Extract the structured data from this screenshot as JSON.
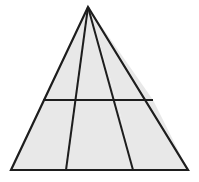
{
  "figure": {
    "kind": "geometry-diagram",
    "shape_name": "triangle",
    "canvas": {
      "width": 199,
      "height": 182,
      "background": "#ffffff"
    },
    "style": {
      "fill": "#e8e8e8",
      "stroke": "#1d1d1d",
      "stroke_width": 2.2,
      "inner_stroke_width": 2.0
    },
    "vertices": {
      "apex": {
        "name": "apex",
        "x": 88,
        "y": 7
      },
      "base_left": {
        "name": "base-left",
        "x": 11,
        "y": 170
      },
      "base_right": {
        "name": "base-right",
        "x": 188,
        "y": 170
      },
      "base_div_left": {
        "name": "base-division-left",
        "x": 66,
        "y": 170
      },
      "base_div_right": {
        "name": "base-division-right",
        "x": 133,
        "y": 170
      },
      "cross_left": {
        "name": "crossbar-left-end",
        "x": 43,
        "y": 100
      },
      "cross_right": {
        "name": "crossbar-right-end",
        "x": 153,
        "y": 100
      },
      "cross_mid_left": {
        "name": "crossbar-cevian-left-intersection",
        "x": 74,
        "y": 100
      },
      "cross_mid_right": {
        "name": "crossbar-cevian-right-intersection",
        "x": 117,
        "y": 100
      }
    },
    "outline_path": "M 88 7 L 188 170 L 11 170 Z",
    "segments": [
      {
        "name": "triangle-outline",
        "type": "closed-polygon",
        "points": "88,7 188,170 11,170"
      },
      {
        "name": "cevian-left",
        "type": "line",
        "x1": 88,
        "y1": 7,
        "x2": 66,
        "y2": 170
      },
      {
        "name": "cevian-right",
        "type": "line",
        "x1": 88,
        "y1": 7,
        "x2": 133,
        "y2": 170
      },
      {
        "name": "crossbar-horizontal",
        "type": "line",
        "x1": 43,
        "y1": 100,
        "x2": 153,
        "y2": 100
      }
    ],
    "regions": [
      {
        "name": "region-top-left",
        "points": "88,7 74,100 43,100"
      },
      {
        "name": "region-top-middle",
        "points": "88,7 117,100 74,100"
      },
      {
        "name": "region-top-right",
        "points": "88,7 153,100 117,100"
      },
      {
        "name": "region-bottom-left",
        "points": "43,100 74,100 66,170 11,170"
      },
      {
        "name": "region-bottom-middle",
        "points": "74,100 117,100 133,170 66,170"
      },
      {
        "name": "region-bottom-right",
        "points": "117,100 153,100 188,170 133,170"
      }
    ],
    "counts": {
      "regions": 6,
      "cevians": 2,
      "crossbars": 1
    },
    "labels": []
  }
}
